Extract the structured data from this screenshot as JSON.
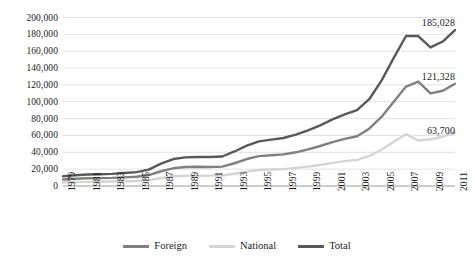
{
  "chart_data": {
    "type": "line",
    "title": "",
    "subtitle": "",
    "xlabel": "",
    "ylabel": "",
    "grid": true,
    "legend_position": "bottom",
    "ylim": [
      0,
      200000
    ],
    "y_ticks": [
      "0",
      "20,000",
      "40,000",
      "60,000",
      "80,000",
      "100,000",
      "120,000",
      "140,000",
      "160,000",
      "180,000",
      "200,000"
    ],
    "y_tick_values": [
      0,
      20000,
      40000,
      60000,
      80000,
      100000,
      120000,
      140000,
      160000,
      180000,
      200000
    ],
    "x": [
      1979,
      1980,
      1981,
      1982,
      1983,
      1984,
      1985,
      1986,
      1987,
      1988,
      1989,
      1990,
      1991,
      1992,
      1993,
      1994,
      1995,
      1996,
      1997,
      1998,
      1999,
      2000,
      2001,
      2002,
      2003,
      2004,
      2005,
      2006,
      2007,
      2008,
      2009,
      2010,
      2011
    ],
    "x_tick_labels": [
      "1979",
      "1981",
      "1983",
      "1985",
      "1987",
      "1989",
      "1991",
      "1993",
      "1995",
      "1997",
      "1999",
      "2001",
      "2003",
      "2005",
      "2007",
      "2009",
      "2011"
    ],
    "x_tick_values": [
      1979,
      1981,
      1983,
      1985,
      1987,
      1989,
      1991,
      1993,
      1995,
      1997,
      1999,
      2001,
      2003,
      2005,
      2007,
      2009,
      2011
    ],
    "series": [
      {
        "name": "Foreign",
        "color": "#808080",
        "values": [
          7800,
          8600,
          9200,
          9400,
          9600,
          10200,
          11000,
          13000,
          17500,
          21000,
          22500,
          22800,
          22600,
          23000,
          27000,
          32000,
          35500,
          36500,
          37500,
          40000,
          43500,
          47500,
          52000,
          56000,
          59000,
          68000,
          82000,
          100000,
          118000,
          124000,
          110000,
          113000,
          121328
        ]
      },
      {
        "name": "National",
        "color": "#d4d4d4",
        "values": [
          4200,
          4600,
          4900,
          5100,
          5300,
          5600,
          6000,
          7000,
          9500,
          11500,
          12000,
          12200,
          12300,
          12500,
          14500,
          17000,
          19000,
          19500,
          20000,
          21500,
          23000,
          25000,
          27500,
          29500,
          31000,
          35500,
          43000,
          52500,
          61500,
          54000,
          55500,
          58500,
          63700
        ]
      },
      {
        "name": "Total",
        "color": "#595959",
        "values": [
          11500,
          12800,
          13600,
          14000,
          14400,
          15400,
          16500,
          19500,
          26500,
          32000,
          34000,
          34500,
          34500,
          35000,
          41000,
          48000,
          53000,
          55000,
          57000,
          61000,
          66000,
          72000,
          79000,
          85000,
          90000,
          103000,
          125000,
          152000,
          178000,
          178000,
          164500,
          171500,
          185028
        ]
      }
    ],
    "point_labels": [
      {
        "text": "185,028",
        "series": "Total",
        "x": 2011,
        "value": 185028
      },
      {
        "text": "121,328",
        "series": "Foreign",
        "x": 2011,
        "value": 121328
      },
      {
        "text": "63,700",
        "series": "National",
        "x": 2011,
        "value": 63700
      }
    ]
  }
}
